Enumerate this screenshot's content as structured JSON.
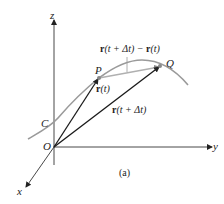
{
  "figure": {
    "caption": "(a)",
    "axes": {
      "z": "z",
      "y": "y",
      "x": "x",
      "origin": "O"
    },
    "curve_label": "C",
    "points": {
      "P": "P",
      "Q": "Q"
    },
    "vectors": {
      "r_t": {
        "bold": "r",
        "arg": "(t)"
      },
      "r_t_dt": {
        "bold": "r",
        "arg": "(t + Δt)"
      },
      "difference": {
        "bold1": "r",
        "arg1": "(t + Δt) − ",
        "bold2": "r",
        "arg2": "(t)"
      }
    },
    "colors": {
      "axis": "#333333",
      "curve": "#9a9a9a",
      "vector": "#1a1a1a",
      "secant": "#b0b0b0"
    }
  }
}
